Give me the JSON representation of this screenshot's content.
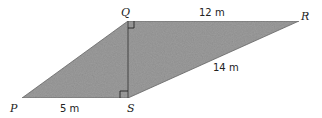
{
  "diagram": {
    "type": "quadrilateral",
    "fill_color": "#9a9a9a",
    "edge_color": "#555555",
    "vertices": {
      "P": {
        "label": "P",
        "x": 22,
        "y": 98
      },
      "S": {
        "label": "S",
        "x": 128,
        "y": 98
      },
      "Q": {
        "label": "Q",
        "x": 128,
        "y": 21
      },
      "R": {
        "label": "R",
        "x": 299,
        "y": 21
      }
    },
    "measurements": {
      "PS": "5 m",
      "QR": "12 m",
      "SR": "14 m"
    },
    "right_angles": [
      "Q",
      "S"
    ]
  }
}
